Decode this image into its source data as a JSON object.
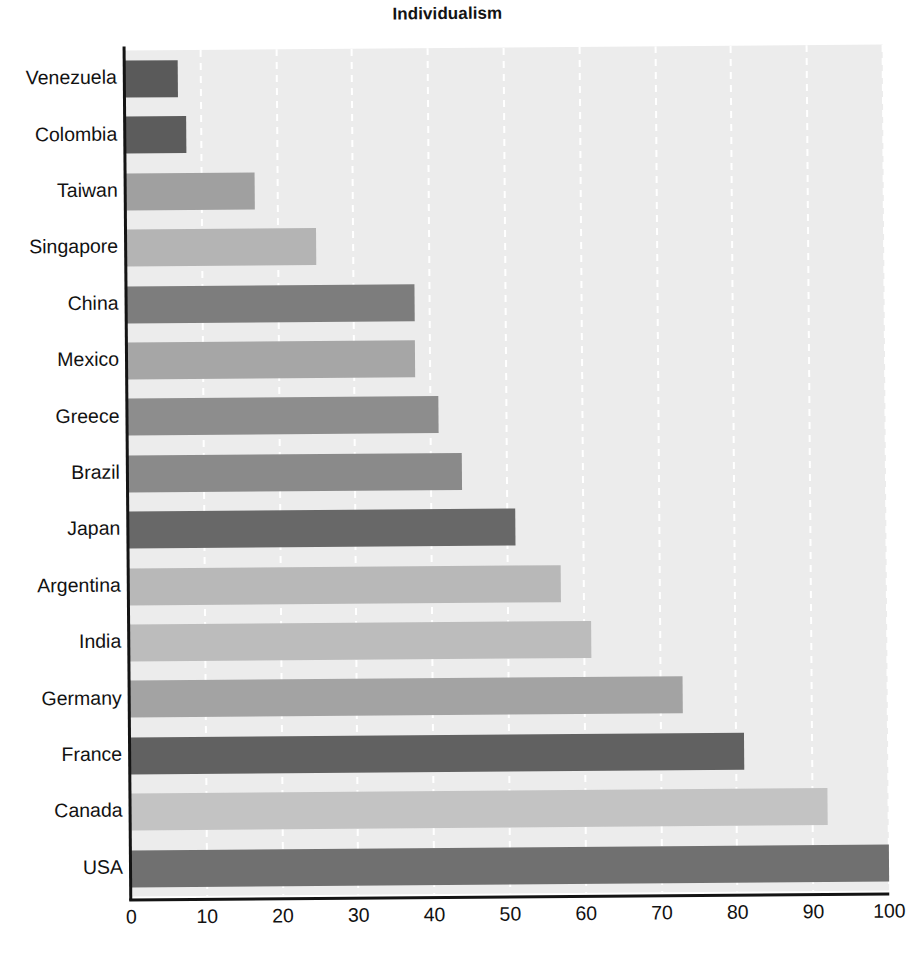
{
  "chart_data": {
    "type": "bar",
    "orientation": "horizontal",
    "title": "Individualism",
    "xlabel": "",
    "ylabel": "",
    "xlim": [
      0,
      100
    ],
    "xticks": [
      0,
      10,
      20,
      30,
      40,
      50,
      60,
      70,
      80,
      90,
      100
    ],
    "grid": "vertical dashed white gridlines",
    "legend": "none",
    "categories": [
      "Venezuela",
      "Colombia",
      "Taiwan",
      "Singapore",
      "China",
      "Mexico",
      "Greece",
      "Brazil",
      "Japan",
      "Argentina",
      "India",
      "Germany",
      "France",
      "Canada",
      "USA"
    ],
    "values": [
      7,
      8,
      17,
      25,
      38,
      38,
      41,
      44,
      51,
      57,
      61,
      73,
      81,
      92,
      100
    ],
    "bar_colors": [
      "#5a5a5a",
      "#5c5c5c",
      "#a0a0a0",
      "#b4b4b4",
      "#7d7d7d",
      "#a6a6a6",
      "#8d8d8d",
      "#8a8a8a",
      "#686868",
      "#b8b8b8",
      "#bcbcbc",
      "#a3a3a3",
      "#616161",
      "#c3c3c3",
      "#707070"
    ],
    "plot_background": "#ececec",
    "axis_color": "#141414",
    "gridline_color": "#ffffff"
  }
}
